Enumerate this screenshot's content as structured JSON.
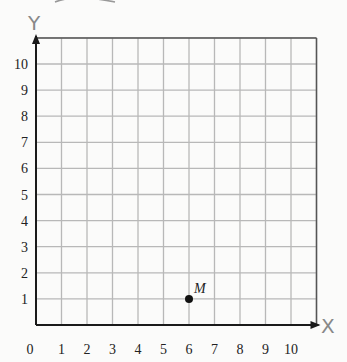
{
  "chart_data": {
    "type": "scatter",
    "title": "",
    "xlabel": "X",
    "ylabel": "Y",
    "xlim": [
      0,
      11
    ],
    "ylim": [
      0,
      11
    ],
    "grid": true,
    "x_ticks": [
      "0",
      "1",
      "2",
      "3",
      "4",
      "5",
      "6",
      "7",
      "8",
      "9",
      "10"
    ],
    "y_ticks": [
      "1",
      "2",
      "3",
      "4",
      "5",
      "6",
      "7",
      "8",
      "9",
      "10"
    ],
    "points": [
      {
        "label": "M",
        "x": 6,
        "y": 1
      }
    ]
  },
  "colors": {
    "grid": "#b8b8b8",
    "axis": "#1a1a1a",
    "point": "#111111",
    "axis_label": "#888888"
  }
}
